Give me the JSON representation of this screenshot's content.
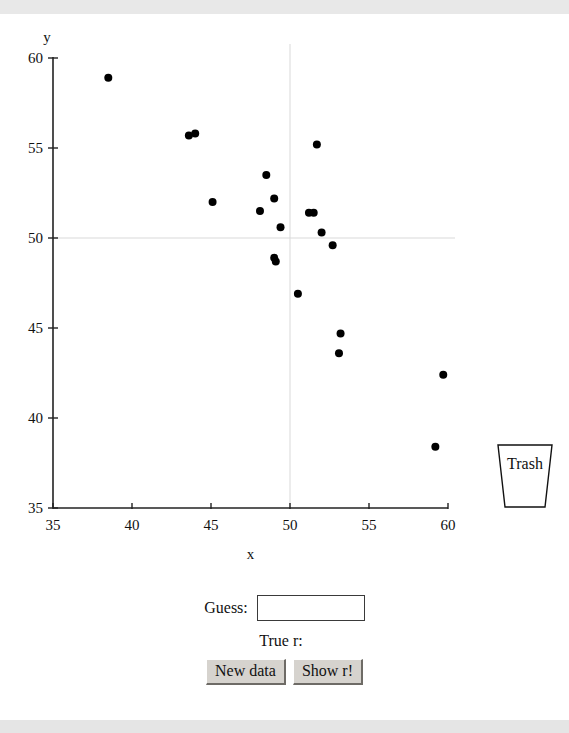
{
  "app": {
    "title": "Guess the Correlation"
  },
  "chart_data": {
    "type": "scatter",
    "title": "",
    "xlabel": "x",
    "ylabel": "y",
    "xlim": [
      35,
      60
    ],
    "ylim": [
      35,
      60
    ],
    "xticks": [
      35,
      40,
      45,
      50,
      55,
      60
    ],
    "yticks": [
      35,
      40,
      45,
      50,
      55,
      60
    ],
    "grid": true,
    "gridlines": {
      "vertical_at_x": 50,
      "horizontal_at_y": 50,
      "color": "#d9d9d9"
    },
    "point_color": "#000000",
    "point_radius_px": 4,
    "points": [
      {
        "x": 38.5,
        "y": 58.9
      },
      {
        "x": 43.6,
        "y": 55.7
      },
      {
        "x": 44.0,
        "y": 55.8
      },
      {
        "x": 45.1,
        "y": 52.0
      },
      {
        "x": 48.1,
        "y": 51.5
      },
      {
        "x": 48.5,
        "y": 53.5
      },
      {
        "x": 49.0,
        "y": 52.2
      },
      {
        "x": 49.0,
        "y": 48.9
      },
      {
        "x": 49.1,
        "y": 48.7
      },
      {
        "x": 49.4,
        "y": 50.6
      },
      {
        "x": 50.5,
        "y": 46.9
      },
      {
        "x": 51.2,
        "y": 51.4
      },
      {
        "x": 51.5,
        "y": 51.4
      },
      {
        "x": 51.7,
        "y": 55.2
      },
      {
        "x": 52.0,
        "y": 50.3
      },
      {
        "x": 52.7,
        "y": 49.6
      },
      {
        "x": 53.2,
        "y": 44.7
      },
      {
        "x": 53.1,
        "y": 43.6
      },
      {
        "x": 59.7,
        "y": 42.4
      },
      {
        "x": 59.2,
        "y": 38.4
      }
    ]
  },
  "axes": {
    "x_axis_label": "x",
    "y_axis_label": "y",
    "x_tick_labels": [
      "35",
      "40",
      "45",
      "50",
      "55",
      "60"
    ],
    "y_tick_labels": [
      "60",
      "55",
      "50",
      "45",
      "40",
      "35"
    ]
  },
  "trash": {
    "label": "Trash"
  },
  "controls": {
    "guess_label": "Guess:",
    "guess_value": "",
    "guess_placeholder": "",
    "true_r_label": "True r:",
    "true_r_value": "",
    "new_data_button": "New data",
    "show_r_button": "Show r!"
  }
}
